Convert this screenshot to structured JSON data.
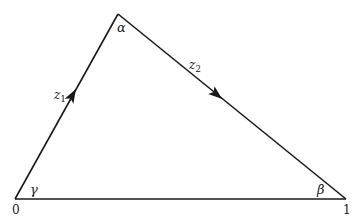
{
  "diagram": {
    "vertices": {
      "origin": {
        "label": "0",
        "angle": "γ"
      },
      "one": {
        "label": "1",
        "angle": "β"
      },
      "apex": {
        "angle": "α"
      }
    },
    "edges": {
      "left": {
        "label": "z",
        "sub": "1"
      },
      "right": {
        "label": "z",
        "sub": "2"
      }
    },
    "colors": {
      "stroke": "#1a1a1a",
      "background": "#ffffff"
    }
  }
}
